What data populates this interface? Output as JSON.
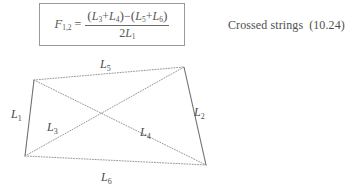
{
  "formula": {
    "lhs_symbol": "F",
    "lhs_subscript": "1,2",
    "equals": "=",
    "numerator": {
      "open_paren_1": "(",
      "term1_symbol": "L",
      "term1_sub": "3",
      "plus_1": "+",
      "term2_symbol": "L",
      "term2_sub": "4",
      "close_paren_1": ")",
      "minus": "−",
      "open_paren_2": "(",
      "term3_symbol": "L",
      "term3_sub": "5",
      "plus_2": "+",
      "term4_symbol": "L",
      "term4_sub": "6",
      "close_paren_2": ")"
    },
    "denominator": {
      "coefficient": "2",
      "symbol": "L",
      "sub": "1"
    },
    "border_color": "#9a9a9a"
  },
  "caption": {
    "text": "Crossed strings",
    "equation_number": "(10.24)"
  },
  "diagram": {
    "line_color": "#8c8c8c",
    "solid_color": "#6f6f6f",
    "vertices": {
      "top_left": {
        "x": 34,
        "y": 32
      },
      "top_right": {
        "x": 184,
        "y": 19
      },
      "bottom_right": {
        "x": 206,
        "y": 117
      },
      "bottom_left": {
        "x": 25,
        "y": 108
      }
    },
    "segments": [
      {
        "name": "L1",
        "from": "top_left",
        "to": "bottom_left",
        "style": "solid"
      },
      {
        "name": "L2",
        "from": "top_right",
        "to": "bottom_right",
        "style": "solid"
      },
      {
        "name": "L3",
        "from": "top_left",
        "to": "bottom_right",
        "style": "dotted"
      },
      {
        "name": "L4",
        "from": "bottom_left",
        "to": "top_right",
        "style": "dotted"
      },
      {
        "name": "L5",
        "from": "top_left",
        "to": "top_right",
        "style": "dotted"
      },
      {
        "name": "L6",
        "from": "bottom_left",
        "to": "bottom_right",
        "style": "dotted"
      }
    ],
    "labels": [
      {
        "id": "L1",
        "symbol": "L",
        "sub": "1",
        "x": 11,
        "y": 70
      },
      {
        "id": "L3",
        "symbol": "L",
        "sub": "3",
        "x": 47,
        "y": 83
      },
      {
        "id": "L4",
        "symbol": "L",
        "sub": "4",
        "x": 140,
        "y": 88
      },
      {
        "id": "L2",
        "symbol": "L",
        "sub": "2",
        "x": 194,
        "y": 68
      },
      {
        "id": "L5",
        "symbol": "L",
        "sub": "5",
        "x": 100,
        "y": 20
      },
      {
        "id": "L6",
        "symbol": "L",
        "sub": "6",
        "x": 101,
        "y": 133
      }
    ]
  }
}
